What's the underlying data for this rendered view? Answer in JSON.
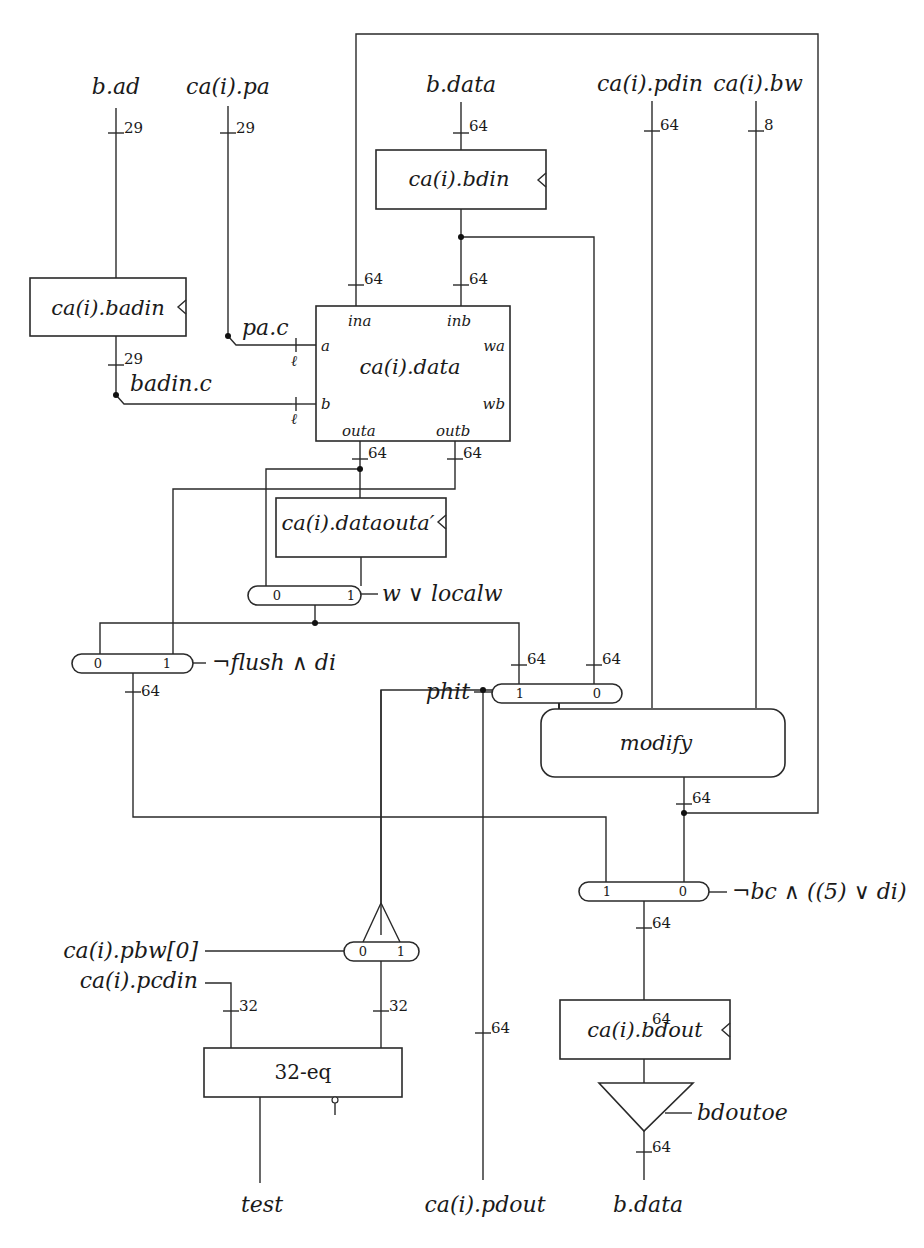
{
  "diagram": {
    "inputs": {
      "b_ad": "b.ad",
      "ca_pa": "ca(i).pa",
      "b_data_in": "b.data",
      "ca_pdin": "ca(i).pdin",
      "ca_bw": "ca(i).bw",
      "ca_pbw0": "ca(i).pbw[0]",
      "ca_pcdin": "ca(i).pcdin"
    },
    "outputs": {
      "test": "test",
      "ca_pdout": "ca(i).pdout",
      "b_data_out": "b.data"
    },
    "registers": {
      "badin": "ca(i).badin",
      "bdin": "ca(i).bdin",
      "dataouta": "ca(i).dataouta′",
      "bdout": "ca(i).bdout"
    },
    "ram": {
      "name": "ca(i).data",
      "ports": {
        "ina": "ina",
        "inb": "inb",
        "a": "a",
        "b": "b",
        "wa": "wa",
        "wb": "wb",
        "outa": "outa",
        "outb": "outb"
      }
    },
    "signals": {
      "pa_c": "pa.c",
      "badin_c": "badin.c",
      "ell_a": "ℓ",
      "ell_b": "ℓ"
    },
    "blocks": {
      "modify": "modify",
      "eq32": "32-eq",
      "driver_enable": "bdoutoe"
    },
    "muxes": [
      {
        "id": "mux-local",
        "left": "0",
        "right": "1",
        "select": "w ∨ localw"
      },
      {
        "id": "mux-flush",
        "left": "0",
        "right": "1",
        "select": "¬flush ∧ di"
      },
      {
        "id": "mux-phit",
        "left": "1",
        "right": "0",
        "select": "phit"
      },
      {
        "id": "mux-bout",
        "left": "1",
        "right": "0",
        "select": "¬bc ∧ ((5) ∨ di)"
      },
      {
        "id": "mux-pbw",
        "left": "0",
        "right": "1",
        "select": "ca(i).pbw[0]"
      }
    ],
    "widths": {
      "b_ad": "29",
      "ca_pa": "29",
      "badin_out": "29",
      "b_data_in": "64",
      "ca_pdin": "64",
      "ca_bw": "8",
      "ina": "64",
      "inb": "64",
      "outa": "64",
      "outb": "64",
      "phit_in1": "64",
      "phit_in0": "64",
      "flush_out": "64",
      "modify_out": "64",
      "bout_out": "64",
      "bdout_out": "64",
      "bdata_out": "64",
      "pdout": "64",
      "eq_a": "32",
      "eq_b": "32"
    }
  }
}
